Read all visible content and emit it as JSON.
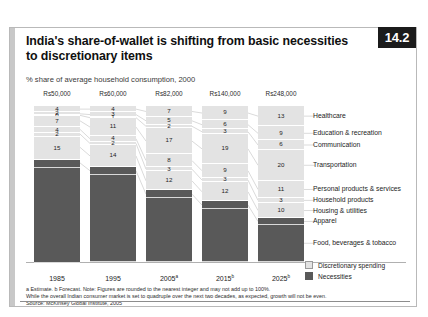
{
  "exhibit": {
    "number": "14.2",
    "title": "India's share-of-wallet is shifting from basic necessities to discretionary items",
    "subtitle": "% share of average household consumption, 2000"
  },
  "legend": {
    "discretionary_label": "Discretionary spending",
    "necessities_label": "Necessities",
    "discretionary_color": "#e3e3e3",
    "necessities_color": "#595959"
  },
  "footnotes": {
    "line1": "a Estimate.  b Forecast. Note: Figures are rounded to the nearest integer and may not add up to 100%.",
    "line2": "While the overall Indian consumer market is set to quadruple over the next two decades, as expected, growth will not be even.",
    "line3": "Source: McKinsey Global Institute, 2005"
  },
  "columns": {
    "headers": [
      "Rs50,000",
      "Rs60,000",
      "Rs82,000",
      "Rs140,000",
      "Rs248,000"
    ],
    "x_labels": [
      "1985",
      "1995",
      "2005",
      "2015",
      "2025"
    ],
    "x_superscripts": [
      "",
      "",
      "a",
      "b",
      "b"
    ]
  },
  "categories": [
    "Healthcare",
    "Education & recreation",
    "Communication",
    "Transportation",
    "Personal products & services",
    "Household products",
    "Housing & utilities",
    "Apparel",
    "Food, beverages & tobacco"
  ],
  "chart_data": {
    "type": "bar",
    "title": "India's share-of-wallet is shifting from basic necessities to discretionary items",
    "subtitle": "% share of average household consumption, 2000",
    "xlabel": "",
    "ylabel": "% share of average household consumption",
    "ylim": [
      0,
      100
    ],
    "grid": false,
    "legend_position": "bottom-right",
    "stacked": true,
    "categories": [
      "1985",
      "1995",
      "2005",
      "2015",
      "2025"
    ],
    "column_headers": [
      "Rs50,000",
      "Rs60,000",
      "Rs82,000",
      "Rs140,000",
      "Rs248,000"
    ],
    "series": [
      {
        "name": "Healthcare",
        "group": "discretionary",
        "values": [
          4,
          4,
          7,
          9,
          13
        ]
      },
      {
        "name": "Education & recreation",
        "group": "discretionary",
        "values": [
          2,
          3,
          5,
          6,
          9
        ]
      },
      {
        "name": "Communication",
        "group": "discretionary",
        "values": [
          0,
          1,
          2,
          3,
          6
        ]
      },
      {
        "name": "Transportation",
        "group": "discretionary",
        "values": [
          7,
          11,
          17,
          19,
          20
        ]
      },
      {
        "name": "Personal products & services",
        "group": "discretionary",
        "values": [
          4,
          4,
          8,
          9,
          11
        ]
      },
      {
        "name": "Household products",
        "group": "discretionary",
        "values": [
          2,
          2,
          3,
          3,
          3
        ]
      },
      {
        "name": "Housing & utilities",
        "group": "discretionary",
        "values": [
          15,
          14,
          12,
          12,
          10
        ]
      },
      {
        "name": "Apparel",
        "group": "necessities",
        "values": [
          5,
          5,
          5,
          5,
          4
        ]
      },
      {
        "name": "Food, beverages & tobacco",
        "group": "necessities",
        "values": [
          61,
          56,
          41,
          34,
          24
        ]
      }
    ],
    "bars": [
      {
        "label": "1985",
        "header": "Rs50,000",
        "segments": [
          {
            "name": "Healthcare",
            "value": 4,
            "show": "4"
          },
          {
            "name": "Education & recreation",
            "value": 2,
            "show": "2"
          },
          {
            "name": "Communication",
            "value": 0,
            "show": "0"
          },
          {
            "name": "Transportation",
            "value": 7,
            "show": "7"
          },
          {
            "name": "Personal products & services",
            "value": 4,
            "show": "4"
          },
          {
            "name": "Household products",
            "value": 2,
            "show": "2"
          },
          {
            "name": "Housing & utilities",
            "value": 15,
            "show": "15"
          },
          {
            "name": "Apparel",
            "value": 5,
            "show": ""
          },
          {
            "name": "Food, beverages & tobacco",
            "value": 61,
            "show": ""
          }
        ]
      },
      {
        "label": "1995",
        "header": "Rs60,000",
        "segments": [
          {
            "name": "Healthcare",
            "value": 4,
            "show": "4"
          },
          {
            "name": "Education & recreation",
            "value": 3,
            "show": "3"
          },
          {
            "name": "Communication",
            "value": 1,
            "show": "1"
          },
          {
            "name": "Transportation",
            "value": 11,
            "show": "11"
          },
          {
            "name": "Personal products & services",
            "value": 4,
            "show": "4"
          },
          {
            "name": "Household products",
            "value": 2,
            "show": "2"
          },
          {
            "name": "Housing & utilities",
            "value": 14,
            "show": "14"
          },
          {
            "name": "Apparel",
            "value": 5,
            "show": ""
          },
          {
            "name": "Food, beverages & tobacco",
            "value": 56,
            "show": ""
          }
        ]
      },
      {
        "label": "2005",
        "header": "Rs82,000",
        "segments": [
          {
            "name": "Healthcare",
            "value": 7,
            "show": "7"
          },
          {
            "name": "Education & recreation",
            "value": 5,
            "show": "5"
          },
          {
            "name": "Communication",
            "value": 2,
            "show": "2"
          },
          {
            "name": "Transportation",
            "value": 17,
            "show": "17"
          },
          {
            "name": "Personal products & services",
            "value": 8,
            "show": "8"
          },
          {
            "name": "Household products",
            "value": 3,
            "show": "3"
          },
          {
            "name": "Housing & utilities",
            "value": 12,
            "show": "12"
          },
          {
            "name": "Apparel",
            "value": 5,
            "show": ""
          },
          {
            "name": "Food, beverages & tobacco",
            "value": 41,
            "show": ""
          }
        ]
      },
      {
        "label": "2015",
        "header": "Rs140,000",
        "segments": [
          {
            "name": "Healthcare",
            "value": 9,
            "show": "9"
          },
          {
            "name": "Education & recreation",
            "value": 6,
            "show": "6"
          },
          {
            "name": "Communication",
            "value": 3,
            "show": "3"
          },
          {
            "name": "Transportation",
            "value": 19,
            "show": "19"
          },
          {
            "name": "Personal products & services",
            "value": 9,
            "show": "9"
          },
          {
            "name": "Household products",
            "value": 3,
            "show": "3"
          },
          {
            "name": "Housing & utilities",
            "value": 12,
            "show": "12"
          },
          {
            "name": "Apparel",
            "value": 5,
            "show": ""
          },
          {
            "name": "Food, beverages & tobacco",
            "value": 34,
            "show": ""
          }
        ]
      },
      {
        "label": "2025",
        "header": "Rs248,000",
        "segments": [
          {
            "name": "Healthcare",
            "value": 13,
            "show": "13"
          },
          {
            "name": "Education & recreation",
            "value": 9,
            "show": "9"
          },
          {
            "name": "Communication",
            "value": 6,
            "show": "6"
          },
          {
            "name": "Transportation",
            "value": 20,
            "show": "20"
          },
          {
            "name": "Personal products & services",
            "value": 11,
            "show": "11"
          },
          {
            "name": "Household products",
            "value": 3,
            "show": "3"
          },
          {
            "name": "Housing & utilities",
            "value": 10,
            "show": "10"
          },
          {
            "name": "Apparel",
            "value": 4,
            "show": ""
          },
          {
            "name": "Food, beverages & tobacco",
            "value": 24,
            "show": ""
          }
        ]
      }
    ]
  }
}
